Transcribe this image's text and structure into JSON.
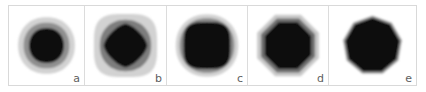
{
  "figure": {
    "type": "multi-panel-image-grid",
    "panel_count": 5,
    "background_color": "#ffffff",
    "frame_color": "#d9d9d9",
    "divider_color": "#dcdcdc",
    "label_color": "#5e5e5e"
  },
  "palette": {
    "background": "#ffffff",
    "halo_light": "#d2d2d2",
    "halo_lighter": "#dedede",
    "ring_mid": "#8f8f8f",
    "ring_dark": "#6e6e6e",
    "core_black": "#111111",
    "core_black_soft": "#1a1a1a"
  },
  "panels": [
    {
      "id": "panel-a",
      "label": "a",
      "description": "concentric circular blob: light gray outer halo, medium gray ring, round black core",
      "core_shape": "circle",
      "layers": [
        {
          "name": "outer-halo",
          "shape": "circle",
          "color": "#d2d2d2",
          "radius": 31
        },
        {
          "name": "mid-ring",
          "shape": "circle",
          "color": "#8f8f8f",
          "radius": 25
        },
        {
          "name": "core",
          "shape": "circle",
          "color": "#111111",
          "radius": 19
        }
      ]
    },
    {
      "id": "panel-b",
      "label": "b",
      "description": "rounded-square light halo, thick medium gray ring, diamond shaped black core",
      "core_shape": "diamond",
      "layers": [
        {
          "name": "outer-halo",
          "shape": "rounded-square",
          "color": "#d2d2d2",
          "radius": 32
        },
        {
          "name": "mid-ring",
          "shape": "circle",
          "color": "#7d7d7d",
          "radius": 26
        },
        {
          "name": "core",
          "shape": "diamond",
          "color": "#111111",
          "radius": 17
        }
      ]
    },
    {
      "id": "panel-c",
      "label": "c",
      "description": "thin light halo, medium gray ring, large rounded-square black core",
      "core_shape": "rounded-square",
      "layers": [
        {
          "name": "outer-halo",
          "shape": "circle",
          "color": "#d2d2d2",
          "radius": 32
        },
        {
          "name": "mid-ring",
          "shape": "circle",
          "color": "#8a8a8a",
          "radius": 28
        },
        {
          "name": "core",
          "shape": "rounded-square",
          "color": "#111111",
          "radius": 24
        }
      ]
    },
    {
      "id": "panel-d",
      "label": "d",
      "description": "octagonal light halo, dark gray octagon ring, octagonal black core",
      "core_shape": "octagon",
      "layers": [
        {
          "name": "outer-halo",
          "shape": "octagon",
          "color": "#c9c9c9",
          "radius": 32
        },
        {
          "name": "mid-ring",
          "shape": "octagon",
          "color": "#6e6e6e",
          "radius": 28
        },
        {
          "name": "core",
          "shape": "octagon",
          "color": "#111111",
          "radius": 24
        }
      ]
    },
    {
      "id": "panel-e",
      "label": "e",
      "description": "single dark polygon with thin soft gray edge, no gray rings",
      "core_shape": "nonagon",
      "layers": [
        {
          "name": "soft-edge",
          "shape": "nonagon",
          "color": "#9a9a9a",
          "radius": 29
        },
        {
          "name": "core",
          "shape": "nonagon",
          "color": "#111111",
          "radius": 27
        }
      ]
    }
  ]
}
